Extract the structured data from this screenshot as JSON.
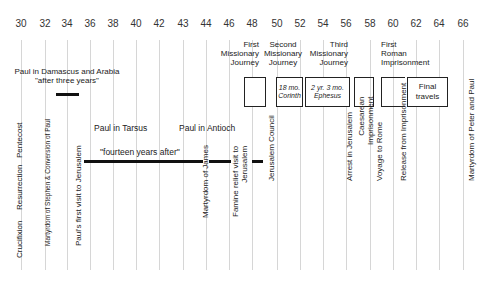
{
  "timeline": {
    "years": [
      {
        "label": "30",
        "x": 21
      },
      {
        "label": "32",
        "x": 45
      },
      {
        "label": "34",
        "x": 67
      },
      {
        "label": "36",
        "x": 90
      },
      {
        "label": "38",
        "x": 113
      },
      {
        "label": "40",
        "x": 136
      },
      {
        "label": "42",
        "x": 159
      },
      {
        "label": "43",
        "x": 183
      },
      {
        "label": "44",
        "x": 206
      },
      {
        "label": "46",
        "x": 229
      },
      {
        "label": "48",
        "x": 252
      },
      {
        "label": "50",
        "x": 277
      },
      {
        "label": "52",
        "x": 300
      },
      {
        "label": "54",
        "x": 323
      },
      {
        "label": "56",
        "x": 346
      },
      {
        "label": "58",
        "x": 370
      },
      {
        "label": "60",
        "x": 393
      },
      {
        "label": "62",
        "x": 416
      },
      {
        "label": "64",
        "x": 439
      },
      {
        "label": "66",
        "x": 463
      }
    ]
  },
  "periods": {
    "damascus": {
      "title": "Paul in Damascus and Arabia",
      "subtitle": "\"after three years\""
    },
    "tarsus": "Paul in Tarsus",
    "antioch": "Paul in Antioch",
    "fourteen": "\"fourteen years after\""
  },
  "journeys": {
    "first": [
      "First",
      "Missionary",
      "Journey"
    ],
    "second": [
      "Second",
      "Missionary",
      "Journey"
    ],
    "third": [
      "Third",
      "Missionary",
      "Journey"
    ],
    "roman": [
      "First",
      "Roman",
      "Imprisonment"
    ]
  },
  "boxes": {
    "corinth": [
      "18 mo.",
      "Corinth"
    ],
    "ephesus": [
      "2 yr. 3 mo.",
      "Ephesus"
    ],
    "final": [
      "Final",
      "travels"
    ]
  },
  "events": {
    "crucifixion": "Crucifixion",
    "resurrection": "Resurrection",
    "pentecost": "Pentecost",
    "stephen": "Martyrdom of Stephen & Conversion of Paul",
    "first_visit": "Paul's first visit to Jerusalem",
    "james": "Martyrdom of James",
    "famine": [
      "Famine relief visit to",
      "Jerusalem"
    ],
    "council": "Jerusalem Council",
    "arrest": "Arrest in Jerusalem",
    "caesarean": [
      "Caesarean",
      "Imprisonment"
    ],
    "voyage": "Voyage to Rome",
    "release": "Release from Imprisonment",
    "peter_paul": "Martyrdom of Peter and Paul"
  }
}
